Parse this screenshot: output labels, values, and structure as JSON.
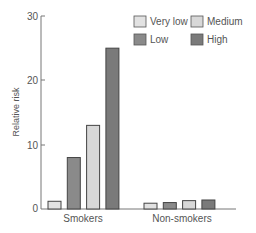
{
  "chart_data": {
    "type": "bar",
    "title": "",
    "xlabel": "",
    "ylabel": "Relative risk",
    "ylim": [
      0,
      30
    ],
    "yticks": [
      0,
      10,
      20,
      30
    ],
    "grid": false,
    "legend_position": "top-right",
    "categories": [
      "Smokers",
      "Non-smokers"
    ],
    "series": [
      {
        "name": "Very low",
        "color": "#e2e2e2",
        "values": [
          1.2,
          0.9
        ]
      },
      {
        "name": "Low",
        "color": "#8a8a8a",
        "values": [
          8,
          1.0
        ]
      },
      {
        "name": "Medium",
        "color": "#d8d8d8",
        "values": [
          13,
          1.3
        ]
      },
      {
        "name": "High",
        "color": "#7a7a7a",
        "values": [
          25,
          1.4
        ]
      }
    ]
  },
  "labels": {
    "ylabel": "Relative risk",
    "y0": "0",
    "y10": "10",
    "y20": "20",
    "y30": "30",
    "cat0": "Smokers",
    "cat1": "Non-smokers",
    "leg0": "Very low",
    "leg1": "Low",
    "leg2": "Medium",
    "leg3": "High"
  }
}
